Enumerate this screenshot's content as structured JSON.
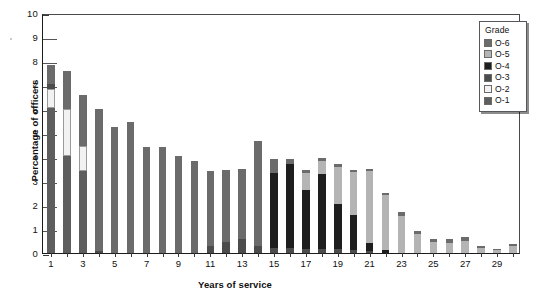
{
  "chart_data": {
    "type": "bar",
    "title": "",
    "subtitle": "",
    "xlabel": "Years of service",
    "ylabel": "Percentage of officers",
    "ylim": [
      0,
      10
    ],
    "ytick_values": [
      0,
      1,
      2,
      3,
      4,
      5,
      6,
      7,
      8,
      9,
      10
    ],
    "ytick_labels": [
      "0",
      "1",
      "2",
      "3",
      "4",
      "5",
      "6",
      "7",
      "8",
      "9",
      "10"
    ],
    "grid": false,
    "stacked": true,
    "legend": {
      "title": "Grade",
      "position": "top-right",
      "entries": [
        {
          "name": "O-6",
          "color": "#6b6b6b"
        },
        {
          "name": "O-5",
          "color": "#b4b4b4"
        },
        {
          "name": "O-4",
          "color": "#1e1e1e"
        },
        {
          "name": "O-3",
          "color": "#4c4c4c"
        },
        {
          "name": "O-2",
          "color": "#f2f2f2"
        },
        {
          "name": "O-1",
          "color": "#5e5e5e"
        }
      ]
    },
    "x": [
      1,
      2,
      3,
      4,
      5,
      6,
      7,
      8,
      9,
      10,
      11,
      12,
      13,
      14,
      15,
      16,
      17,
      18,
      19,
      20,
      21,
      22,
      23,
      24,
      25,
      26,
      27,
      28,
      29,
      30
    ],
    "xtick_labels": [
      "1",
      "",
      "3",
      "",
      "5",
      "",
      "7",
      "",
      "9",
      "",
      "11",
      "",
      "13",
      "",
      "15",
      "",
      "17",
      "",
      "19",
      "",
      "21",
      "",
      "23",
      "",
      "25",
      "",
      "27",
      "",
      "29",
      ""
    ],
    "series": [
      {
        "name": "O-1",
        "color": "#5e5e5e",
        "values": [
          6.05,
          4.05,
          3.4,
          0.0,
          0.0,
          0.0,
          0.0,
          0.0,
          0.0,
          0.0,
          0.0,
          0.0,
          0.0,
          0.0,
          0.0,
          0.0,
          0.0,
          0.0,
          0.0,
          0.0,
          0.0,
          0.0,
          0.0,
          0.0,
          0.0,
          0.0,
          0.0,
          0.0,
          0.0,
          0.0
        ]
      },
      {
        "name": "O-2",
        "color": "#f2f2f2",
        "values": [
          0.78,
          1.95,
          1.05,
          0.0,
          0.0,
          0.0,
          0.0,
          0.0,
          0.0,
          0.0,
          0.0,
          0.0,
          0.0,
          0.0,
          0.0,
          0.0,
          0.0,
          0.0,
          0.0,
          0.0,
          0.0,
          0.0,
          0.0,
          0.0,
          0.0,
          0.0,
          0.0,
          0.0,
          0.0,
          0.0
        ]
      },
      {
        "name": "O-3",
        "color": "#4c4c4c",
        "values": [
          0.2,
          0.0,
          0.0,
          0.1,
          0.0,
          0.0,
          0.0,
          0.0,
          0.0,
          0.0,
          0.3,
          0.45,
          0.6,
          0.3,
          0.22,
          0.2,
          0.18,
          0.15,
          0.15,
          0.12,
          0.1,
          0.0,
          0.0,
          0.0,
          0.0,
          0.0,
          0.0,
          0.0,
          0.0,
          0.0
        ]
      },
      {
        "name": "O-4",
        "color": "#1e1e1e",
        "values": [
          0.0,
          0.0,
          0.0,
          0.0,
          0.0,
          0.0,
          0.0,
          0.0,
          0.0,
          0.0,
          0.0,
          0.0,
          0.0,
          0.0,
          3.1,
          3.5,
          2.45,
          3.15,
          1.9,
          1.45,
          0.3,
          0.12,
          0.0,
          0.0,
          0.0,
          0.0,
          0.0,
          0.0,
          0.0,
          0.0
        ]
      },
      {
        "name": "O-5",
        "color": "#b4b4b4",
        "values": [
          0.0,
          0.0,
          0.0,
          0.0,
          0.0,
          0.0,
          0.0,
          0.0,
          0.0,
          0.0,
          0.0,
          0.0,
          0.0,
          0.0,
          0.0,
          0.0,
          0.7,
          0.55,
          1.55,
          1.8,
          3.0,
          2.3,
          1.55,
          0.78,
          0.45,
          0.4,
          0.5,
          0.22,
          0.12,
          0.28
        ]
      },
      {
        "name": "O-6",
        "color": "#6b6b6b",
        "values": [
          0.82,
          1.58,
          2.15,
          5.9,
          5.25,
          5.45,
          4.4,
          4.4,
          4.05,
          3.85,
          3.1,
          3.0,
          2.9,
          4.35,
          0.58,
          0.2,
          0.15,
          0.1,
          0.1,
          0.1,
          0.1,
          0.1,
          0.15,
          0.15,
          0.15,
          0.18,
          0.18,
          0.08,
          0.05,
          0.08
        ]
      }
    ],
    "totals": [
      7.85,
      7.58,
      6.6,
      6.0,
      5.25,
      5.45,
      4.4,
      4.4,
      4.05,
      3.85,
      3.4,
      3.45,
      3.5,
      4.65,
      3.9,
      3.9,
      3.48,
      3.95,
      3.7,
      3.47,
      3.5,
      2.52,
      1.7,
      0.93,
      0.6,
      0.58,
      0.68,
      0.3,
      0.17,
      0.36
    ]
  }
}
